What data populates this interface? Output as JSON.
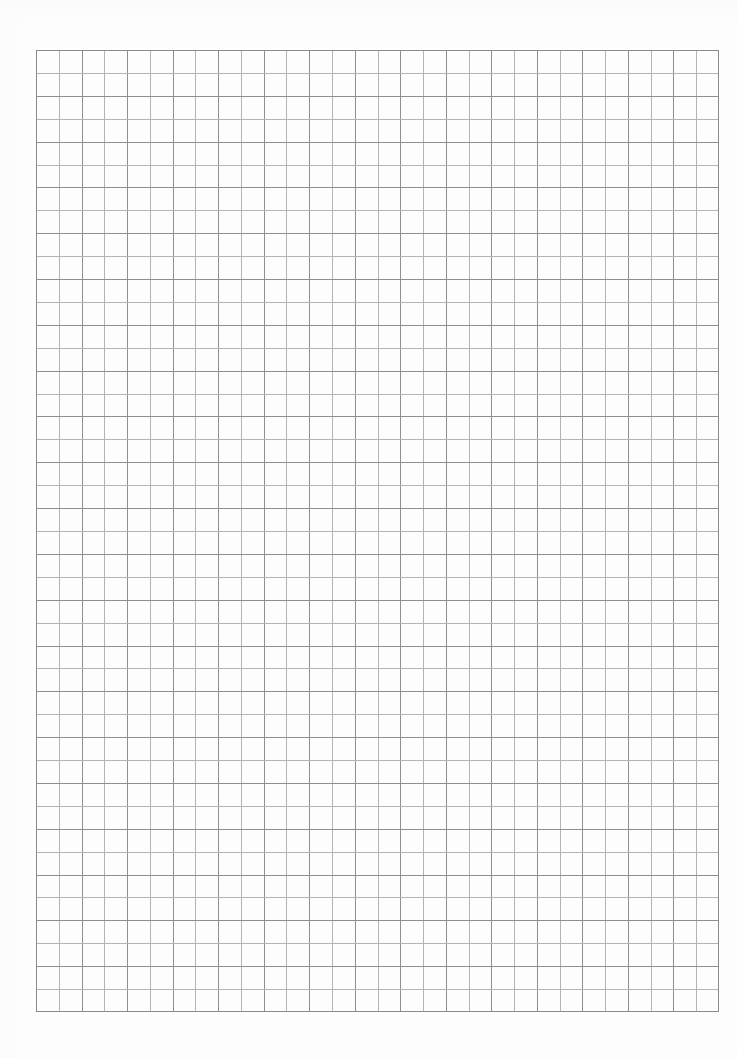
{
  "document": {
    "kind": "graph-paper-scan",
    "page_width_px": 737,
    "page_height_px": 1058,
    "background_color": "#fdfdfd",
    "paper_color": "#ffffff",
    "visible_text": "",
    "caption": ""
  },
  "grid": {
    "label": "square grid",
    "columns": 30,
    "rows": 42,
    "cell_width_px": 22.77,
    "cell_height_px": 22.9,
    "origin_x_px": 36,
    "origin_y_px": 50,
    "width_px": 683,
    "height_px": 962,
    "line_color": "#8d8d92",
    "alt_line_color": "#b4b4b8",
    "border_color": "#8a8a8f",
    "line_width_px": 1,
    "has_major_lines": false
  },
  "margins": {
    "left_px": 36,
    "top_px": 50,
    "right_px": 18,
    "bottom_px": 46
  },
  "chart_data": {
    "type": "table",
    "title": "",
    "xlabel": "",
    "ylabel": "",
    "categories": [],
    "values": [],
    "note": "Blank graph paper — no plotted data, labels, ticks or legend present."
  }
}
